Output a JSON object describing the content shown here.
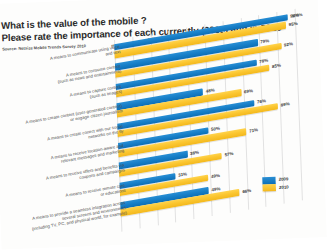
{
  "title": {
    "line1": "What is the value of the mobile ?",
    "line2": "Please rate the importance of each currently (2009) and in 2010",
    "source": "Source: Netsize Mobile Trends Survey 2010"
  },
  "legend": {
    "items": [
      {
        "label": "2009",
        "color": "#1880c9"
      },
      {
        "label": "2010",
        "color": "#fbc630"
      }
    ]
  },
  "chart_data": {
    "type": "bar",
    "orientation": "horizontal",
    "title": "What is the value of the mobile ? Please rate the importance of each currently (2009) and in 2010",
    "subtitle": "Source: Netsize Mobile Trends Survey 2010",
    "xlabel": "",
    "ylabel": "",
    "xlim": [
      0,
      100
    ],
    "xticks": [
      "0%",
      "10%",
      "20%",
      "30%",
      "40%",
      "50%",
      "60%",
      "70%",
      "80%",
      "90%",
      "100%"
    ],
    "grid": true,
    "legend_position": "bottom-right",
    "categories": [
      "A means to communicate using voice\nand text",
      "A means to consume content\n(such as news and entertainment)",
      "A means to capture content\n(such as images)",
      "A means to create content (user-generated content)\nor engage citizen journalism",
      "A means to create conect with our social\nnetworks on the fly",
      "A means to receive location-aware and\nrelevant messages and marketing",
      "A means to receive offers and benefits via\ncoupons and campaigns",
      "A means to receive remote care\nor educations",
      "A means to provide a seamless integration across\nseveral screens and environments\n(including TV, PC, and physical world, for example)"
    ],
    "series": [
      {
        "name": "2009",
        "color": "#1880c9",
        "values": [
          96,
          79,
          78,
          48,
          76,
          50,
          38,
          31,
          49
        ],
        "labels": [
          "96%",
          "79%",
          "78%",
          "48%",
          "76%",
          "50%",
          "38%",
          "31%",
          "49%"
        ]
      },
      {
        "name": "2010",
        "color": "#fbc630",
        "values": [
          95,
          92,
          85,
          69,
          89,
          71,
          57,
          49,
          66
        ],
        "labels": [
          "95%",
          "92%",
          "85%",
          "69%",
          "89%",
          "71%",
          "57%",
          "49%",
          "66%"
        ]
      }
    ]
  }
}
